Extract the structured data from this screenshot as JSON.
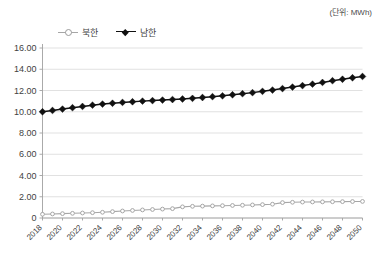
{
  "unit_note": "(단위: MWh)",
  "legend": {
    "position": "top-left",
    "items": [
      {
        "label": "북한",
        "color": "#a6a6a6",
        "marker": "circle"
      },
      {
        "label": "남한",
        "color": "#111111",
        "marker": "diamond"
      }
    ]
  },
  "axes": {
    "y_label": "",
    "x_label": "",
    "y_ticks": [
      "0",
      "2.00",
      "4.00",
      "6.00",
      "8.00",
      "10.00",
      "12.00",
      "14.00",
      "16.00"
    ],
    "x_ticks": [
      "2018",
      "2020",
      "2022",
      "2024",
      "2026",
      "2028",
      "2030",
      "2032",
      "2034",
      "2036",
      "2038",
      "2040",
      "2042",
      "2044",
      "2046",
      "2048",
      "2050"
    ]
  },
  "chart_data": {
    "type": "line",
    "title": "",
    "subtitle": "",
    "xlabel": "",
    "ylabel": "",
    "unit": "MWh",
    "ylim": [
      0,
      16
    ],
    "ytick_step": 2,
    "grid": true,
    "legend_position": "top-left",
    "x": [
      2018,
      2019,
      2020,
      2021,
      2022,
      2023,
      2024,
      2025,
      2026,
      2027,
      2028,
      2029,
      2030,
      2031,
      2032,
      2033,
      2034,
      2035,
      2036,
      2037,
      2038,
      2039,
      2040,
      2041,
      2042,
      2043,
      2044,
      2045,
      2046,
      2047,
      2048,
      2049,
      2050
    ],
    "x_tick_labels": [
      "2018",
      "2020",
      "2022",
      "2024",
      "2026",
      "2028",
      "2030",
      "2032",
      "2034",
      "2036",
      "2038",
      "2040",
      "2042",
      "2044",
      "2046",
      "2048",
      "2050"
    ],
    "series": [
      {
        "name": "북한",
        "color": "#a6a6a6",
        "marker": "circle",
        "values": [
          0.35,
          0.38,
          0.41,
          0.44,
          0.47,
          0.5,
          0.54,
          0.6,
          0.66,
          0.71,
          0.76,
          0.8,
          0.84,
          0.88,
          1.05,
          1.1,
          1.12,
          1.14,
          1.16,
          1.18,
          1.2,
          1.23,
          1.26,
          1.3,
          1.45,
          1.48,
          1.5,
          1.51,
          1.52,
          1.53,
          1.54,
          1.55,
          1.56
        ]
      },
      {
        "name": "남한",
        "color": "#111111",
        "marker": "diamond",
        "values": [
          10.0,
          10.12,
          10.25,
          10.38,
          10.5,
          10.62,
          10.72,
          10.8,
          10.88,
          10.94,
          11.0,
          11.05,
          11.1,
          11.15,
          11.2,
          11.26,
          11.34,
          11.42,
          11.5,
          11.6,
          11.7,
          11.8,
          11.92,
          12.04,
          12.18,
          12.32,
          12.46,
          12.6,
          12.76,
          12.92,
          13.06,
          13.2,
          13.32
        ]
      }
    ]
  }
}
